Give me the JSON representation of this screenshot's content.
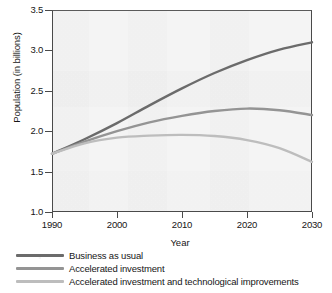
{
  "chart_data": {
    "type": "line",
    "title": "",
    "xlabel": "Year",
    "ylabel": "Population (in billions)",
    "xlim": [
      1990,
      2030
    ],
    "ylim": [
      1.0,
      3.5
    ],
    "xticks": [
      "1990",
      "2000",
      "2010",
      "2020",
      "2030"
    ],
    "yticks": [
      "1.0",
      "1.5",
      "2.0",
      "2.5",
      "3.0",
      "3.5"
    ],
    "grid": false,
    "legend_position": "below-plot",
    "x": [
      1990,
      1995,
      2000,
      2005,
      2010,
      2015,
      2020,
      2025,
      2030
    ],
    "series": [
      {
        "name": "Business as usual",
        "color": "#6b6b6b",
        "values": [
          1.72,
          1.9,
          2.1,
          2.32,
          2.53,
          2.72,
          2.88,
          3.01,
          3.1
        ]
      },
      {
        "name": "Accelerated investment",
        "color": "#949494",
        "values": [
          1.72,
          1.87,
          2.0,
          2.11,
          2.19,
          2.25,
          2.28,
          2.26,
          2.2
        ]
      },
      {
        "name": "Accelerated investment and technological improvements",
        "color": "#bdbdbd",
        "values": [
          1.72,
          1.85,
          1.92,
          1.945,
          1.955,
          1.94,
          1.89,
          1.79,
          1.62
        ]
      }
    ]
  }
}
